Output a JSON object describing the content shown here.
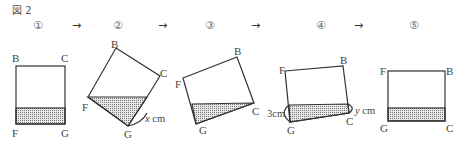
{
  "figure": {
    "title": "図 2",
    "steps": [
      "①",
      "②",
      "③",
      "④",
      "⑤"
    ],
    "arrow": "→"
  },
  "shapes": [
    {
      "step": "①",
      "vertices": {
        "B": "B",
        "C": "C",
        "F": "F",
        "G": "G"
      },
      "shaded": "band along FG"
    },
    {
      "step": "②",
      "vertices": {
        "B": "B",
        "C": "C",
        "F": "F",
        "G": "G"
      },
      "shaded": "triangle at F-G",
      "dimension": {
        "var": "x",
        "unit": "cm"
      }
    },
    {
      "step": "③",
      "vertices": {
        "B": "B",
        "C": "C",
        "F": "F",
        "G": "G"
      },
      "shaded": "triangle at G-C"
    },
    {
      "step": "④",
      "vertices": {
        "B": "B",
        "C": "C",
        "F": "F",
        "G": "G"
      },
      "shaded": "band along GC",
      "dimensions": [
        {
          "value": "3",
          "unit": "cm"
        },
        {
          "var": "y",
          "unit": "cm"
        }
      ]
    },
    {
      "step": "⑤",
      "vertices": {
        "B": "B",
        "C": "C",
        "F": "F",
        "G": "G"
      },
      "shaded": "band along GC"
    }
  ]
}
